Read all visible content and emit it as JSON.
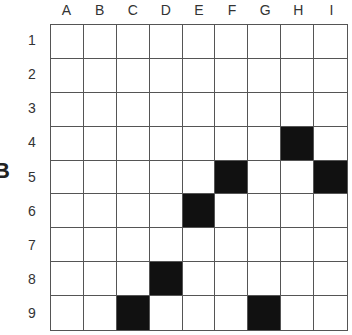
{
  "side_mark": "B",
  "columns": [
    "A",
    "B",
    "C",
    "D",
    "E",
    "F",
    "G",
    "H",
    "I"
  ],
  "rows": [
    "1",
    "2",
    "3",
    "4",
    "5",
    "6",
    "7",
    "8",
    "9"
  ],
  "filled_cells": [
    "H4",
    "F5",
    "I5",
    "E6",
    "D8",
    "C9",
    "G9"
  ],
  "colors": {
    "filled": "#111111",
    "empty": "#ffffff",
    "grid_line": "#555555"
  }
}
